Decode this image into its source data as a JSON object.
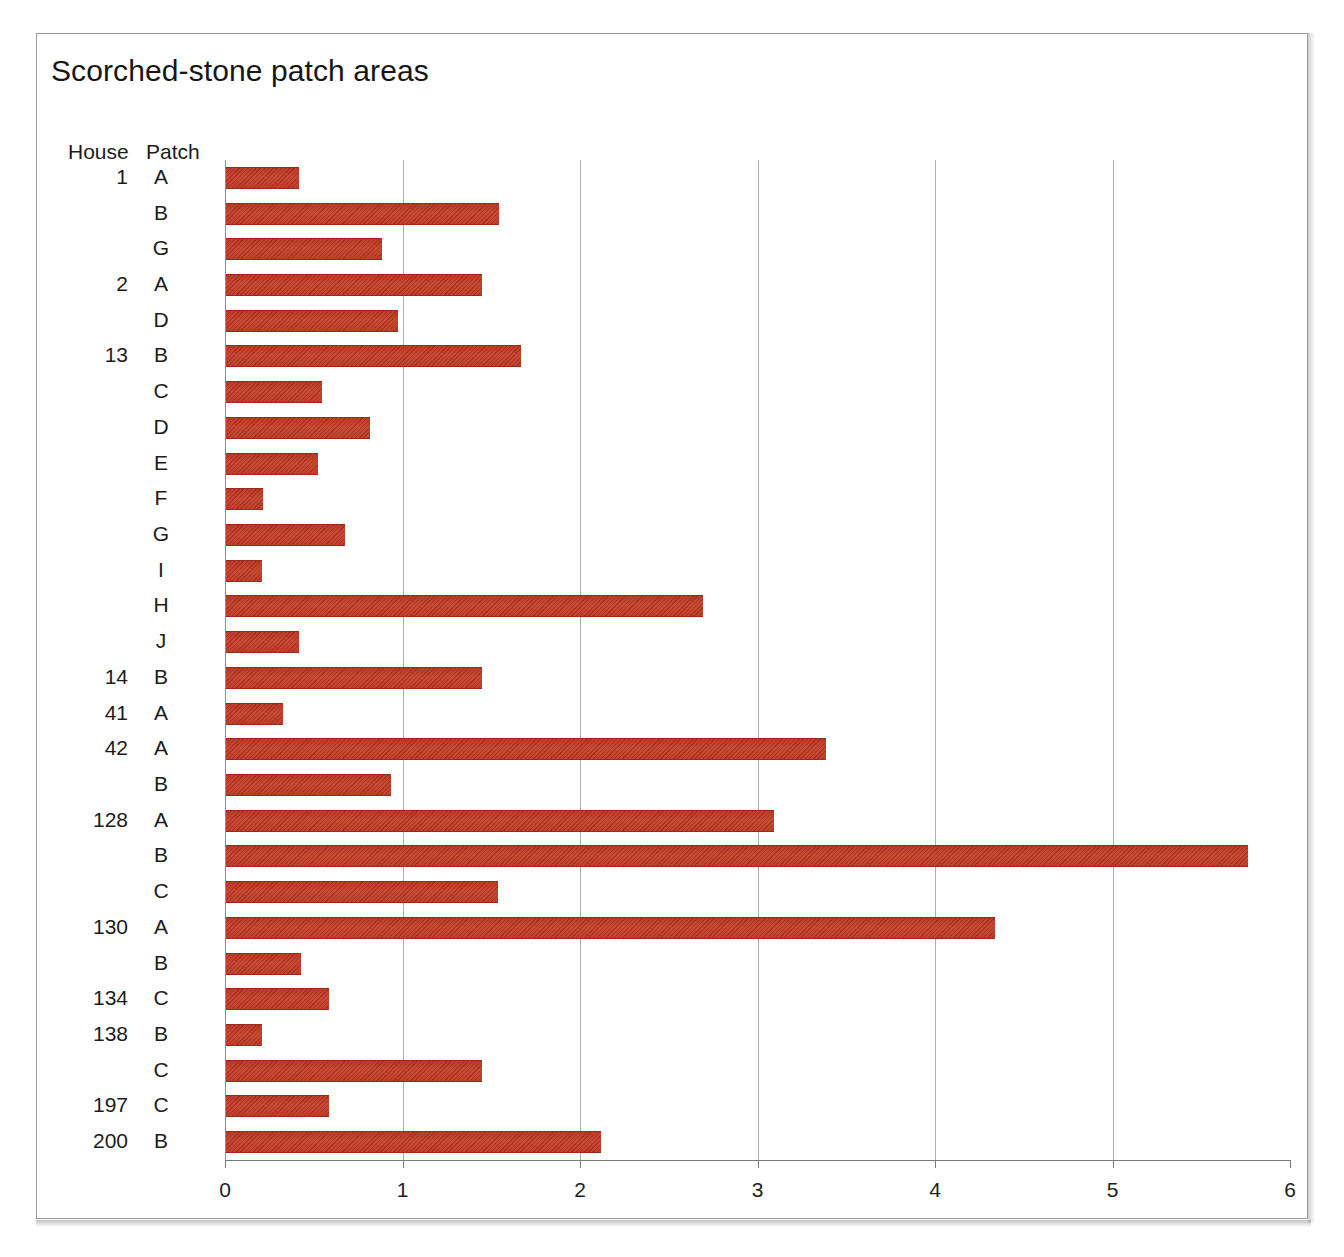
{
  "figure": {
    "title": "Scorched-stone patch areas",
    "column_headers": {
      "house": "House",
      "patch": "Patch"
    }
  },
  "chart_data": {
    "type": "bar",
    "orientation": "horizontal",
    "title": "Scorched-stone patch areas",
    "xlabel": "",
    "ylabel": "",
    "xlim": [
      0,
      6
    ],
    "xticks": [
      0,
      1,
      2,
      3,
      4,
      5,
      6
    ],
    "xtick_labels": [
      "0",
      "1",
      "2",
      "3",
      "4",
      "5",
      "6"
    ],
    "grid": "vertical-only",
    "legend": "none",
    "bar_color": "#bd3622",
    "group_label": "House",
    "category_label": "Patch",
    "categories": [
      "1 A",
      "1 B",
      "1 G",
      "2 A",
      "2 D",
      "13 B",
      "13 C",
      "13 D",
      "13 E",
      "13 F",
      "13 G",
      "13 I",
      "13 H",
      "13 J",
      "14 B",
      "41 A",
      "42 A",
      "42 B",
      "128 A",
      "128 B",
      "128 C",
      "130 A",
      "130 B",
      "134 C",
      "138 B",
      "138 C",
      "197 C",
      "200 B"
    ],
    "values": [
      0.41,
      1.54,
      0.88,
      1.44,
      0.97,
      1.66,
      0.54,
      0.81,
      0.52,
      0.21,
      0.67,
      0.2,
      2.69,
      0.41,
      1.44,
      0.32,
      3.38,
      0.93,
      3.09,
      5.76,
      1.53,
      4.33,
      0.42,
      0.58,
      0.2,
      1.44,
      0.58,
      2.11
    ]
  },
  "rows": [
    {
      "house": "1",
      "patch": "A",
      "value": 0.41
    },
    {
      "house": "",
      "patch": "B",
      "value": 1.54
    },
    {
      "house": "",
      "patch": "G",
      "value": 0.88
    },
    {
      "house": "2",
      "patch": "A",
      "value": 1.44
    },
    {
      "house": "",
      "patch": "D",
      "value": 0.97
    },
    {
      "house": "13",
      "patch": "B",
      "value": 1.66
    },
    {
      "house": "",
      "patch": "C",
      "value": 0.54
    },
    {
      "house": "",
      "patch": "D",
      "value": 0.81
    },
    {
      "house": "",
      "patch": "E",
      "value": 0.52
    },
    {
      "house": "",
      "patch": "F",
      "value": 0.21
    },
    {
      "house": "",
      "patch": "G",
      "value": 0.67
    },
    {
      "house": "",
      "patch": "I",
      "value": 0.2
    },
    {
      "house": "",
      "patch": "H",
      "value": 2.69
    },
    {
      "house": "",
      "patch": "J",
      "value": 0.41
    },
    {
      "house": "14",
      "patch": "B",
      "value": 1.44
    },
    {
      "house": "41",
      "patch": "A",
      "value": 0.32
    },
    {
      "house": "42",
      "patch": "A",
      "value": 3.38
    },
    {
      "house": "",
      "patch": "B",
      "value": 0.93
    },
    {
      "house": "128",
      "patch": "A",
      "value": 3.09
    },
    {
      "house": "",
      "patch": "B",
      "value": 5.76
    },
    {
      "house": "",
      "patch": "C",
      "value": 1.53
    },
    {
      "house": "130",
      "patch": "A",
      "value": 4.33
    },
    {
      "house": "",
      "patch": "B",
      "value": 0.42
    },
    {
      "house": "134",
      "patch": "C",
      "value": 0.58
    },
    {
      "house": "138",
      "patch": "B",
      "value": 0.2
    },
    {
      "house": "",
      "patch": "C",
      "value": 1.44
    },
    {
      "house": "197",
      "patch": "C",
      "value": 0.58
    },
    {
      "house": "200",
      "patch": "B",
      "value": 2.11
    }
  ]
}
